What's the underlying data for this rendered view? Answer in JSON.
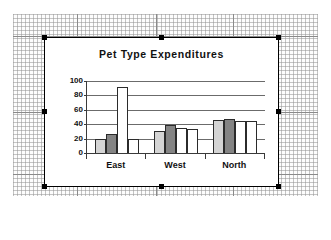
{
  "workbook": {
    "background_label": "spreadsheet-grid"
  },
  "chart_object": {
    "selected": true,
    "handles": 8
  },
  "chart_data": {
    "type": "bar",
    "title": "Pet Type Expenditures",
    "xlabel": "",
    "ylabel": "",
    "categories": [
      "East",
      "West",
      "North"
    ],
    "series": [
      {
        "name": "Series 1",
        "color": "#d4d4d4",
        "values": [
          20,
          31,
          46
        ]
      },
      {
        "name": "Series 2",
        "color": "#848484",
        "values": [
          26,
          39,
          47
        ]
      },
      {
        "name": "Series 3",
        "color": "#ffffff",
        "values": [
          91,
          35,
          45
        ]
      },
      {
        "name": "Series 4",
        "color": "#ffffff",
        "values": [
          20,
          33,
          44
        ]
      }
    ],
    "ylim": [
      0,
      100
    ],
    "yticks": [
      0,
      20,
      40,
      60,
      80,
      100
    ],
    "ytick_labels": [
      "0",
      "20",
      "40",
      "60",
      "80",
      "100"
    ],
    "grid": true,
    "legend": "none"
  }
}
